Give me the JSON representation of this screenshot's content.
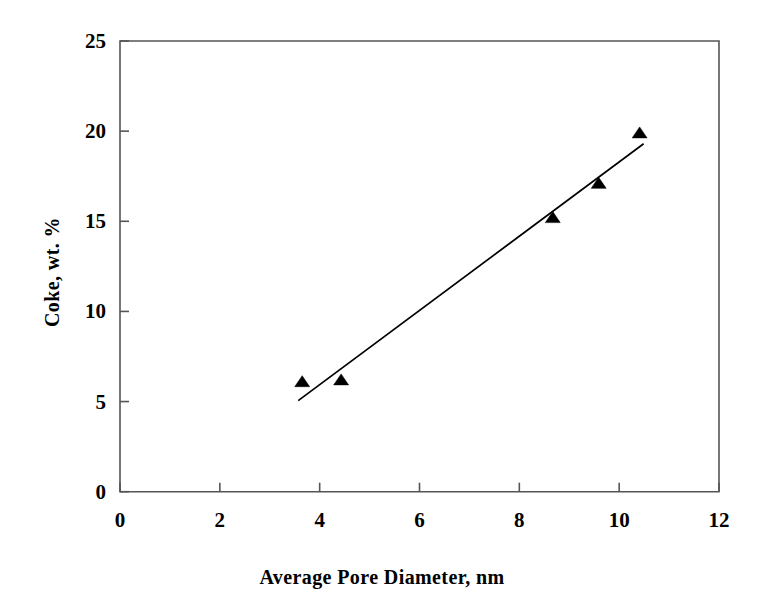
{
  "chart_data": {
    "type": "scatter",
    "title": "",
    "xlabel": "Average Pore Diameter, nm",
    "ylabel": "Coke, wt. %",
    "xlim": [
      0,
      12
    ],
    "ylim": [
      0,
      25
    ],
    "xticks": [
      0,
      2,
      4,
      6,
      8,
      10,
      12
    ],
    "yticks": [
      0,
      5,
      10,
      15,
      20,
      25
    ],
    "xtick_labels": [
      "0",
      "2",
      "4",
      "6",
      "8",
      "10",
      "12"
    ],
    "ytick_labels": [
      "0",
      "5",
      "10",
      "15",
      "20",
      "25"
    ],
    "grid": false,
    "legend": null,
    "marker": "triangle-up",
    "marker_color": "#000000",
    "line_color": "#000000",
    "frame_color": "#555555",
    "series": [
      {
        "name": "Coke vs Average Pore Diameter",
        "points": [
          {
            "x": 3.65,
            "y": 6.1
          },
          {
            "x": 4.43,
            "y": 6.2
          },
          {
            "x": 8.67,
            "y": 15.2
          },
          {
            "x": 9.59,
            "y": 17.1
          },
          {
            "x": 10.41,
            "y": 19.9
          }
        ]
      }
    ],
    "trendline": {
      "type": "linear",
      "x_start": 3.57,
      "y_start": 5.05,
      "x_end": 10.49,
      "y_end": 19.3,
      "slope": 2.06,
      "intercept": -2.31
    }
  }
}
